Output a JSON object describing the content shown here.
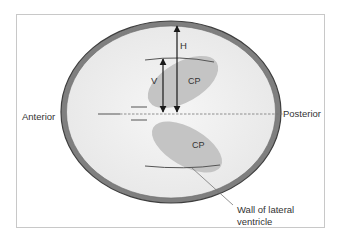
{
  "diagram": {
    "labels": {
      "anterior": "Anterior",
      "posterior": "Posterior",
      "h": "H",
      "v": "V",
      "cp_upper": "CP",
      "cp_lower": "CP",
      "wall": "Wall of lateral ventricle"
    },
    "measurements": [
      {
        "name": "H",
        "description": "arrow from midline to outer wall (top)"
      },
      {
        "name": "V",
        "description": "arrow from midline to ventricle wall (top)"
      }
    ],
    "colors": {
      "frame": "#c8c8c8",
      "outer_wall": "#8a8a8a",
      "outer_wall_edge": "#4a4a4a",
      "interior": "#f0f0f0",
      "choroid_plexus": "#c4c4c4",
      "lines": "#555555",
      "arrows": "#1a1a1a",
      "text": "#333333"
    }
  }
}
